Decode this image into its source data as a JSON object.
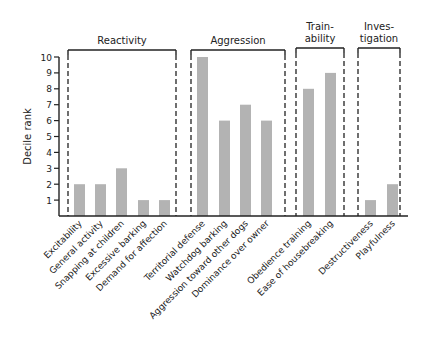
{
  "chart_data": {
    "type": "bar",
    "title": "",
    "xlabel": "",
    "ylabel": "Decile rank",
    "ylim": [
      0,
      10
    ],
    "yticks": [
      1,
      2,
      3,
      4,
      5,
      6,
      7,
      8,
      9,
      10
    ],
    "grid": false,
    "legend": null,
    "categories": [
      "Excitability",
      "General activity",
      "Snapping at children",
      "Excessive barking",
      "Demand for affection",
      "Territorial defense",
      "Watchdog barking",
      "Aggression toward other dogs",
      "Dominance over owner",
      "Obedience training",
      "Ease of housebreaking",
      "Destructiveness",
      "Playfulness"
    ],
    "values": [
      2,
      2,
      3,
      1,
      1,
      10,
      6,
      7,
      6,
      8,
      9,
      1,
      2
    ],
    "groups": [
      {
        "label_lines": [
          "Reactivity"
        ],
        "members": [
          0,
          1,
          2,
          3,
          4
        ]
      },
      {
        "label_lines": [
          "Aggression"
        ],
        "members": [
          5,
          6,
          7,
          8
        ]
      },
      {
        "label_lines": [
          "Train-",
          "ability"
        ],
        "members": [
          9,
          10
        ]
      },
      {
        "label_lines": [
          "Inves-",
          "tigation"
        ],
        "members": [
          11,
          12
        ]
      }
    ],
    "colors": {
      "bar": "#b3b3b3",
      "axis": "#222222",
      "group_box": "#222222",
      "text": "#222222"
    }
  }
}
